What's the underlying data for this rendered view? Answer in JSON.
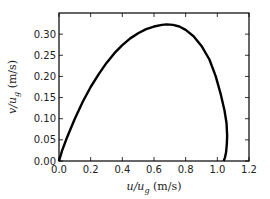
{
  "chart_data": {
    "type": "line",
    "title": "",
    "xlabel": "u/u_g (m/s)",
    "ylabel": "v/u_g (m/s)",
    "xlabel_parts": {
      "num": "u",
      "den": "u",
      "sub": "g",
      "unit": "(m/s)"
    },
    "ylabel_parts": {
      "num": "v",
      "den": "u",
      "sub": "g",
      "unit": "(m/s)"
    },
    "xlim": [
      0.0,
      1.2
    ],
    "ylim": [
      0.0,
      0.35
    ],
    "xticks": [
      "0.0",
      "0.2",
      "0.4",
      "0.6",
      "0.8",
      "1.0",
      "1.2"
    ],
    "yticks": [
      "0.00",
      "0.05",
      "0.10",
      "0.15",
      "0.20",
      "0.25",
      "0.30"
    ],
    "grid": false,
    "legend": null,
    "series": [
      {
        "name": "hodograph",
        "color": "#000000",
        "x": [
          0.0,
          0.02,
          0.05,
          0.1,
          0.15,
          0.2,
          0.25,
          0.3,
          0.35,
          0.4,
          0.45,
          0.5,
          0.55,
          0.6,
          0.65,
          0.68,
          0.72,
          0.76,
          0.8,
          0.85,
          0.9,
          0.95,
          0.99,
          1.02,
          1.045,
          1.058,
          1.062,
          1.06,
          1.055,
          1.048,
          1.04
        ],
        "y": [
          0.0,
          0.025,
          0.055,
          0.1,
          0.14,
          0.175,
          0.205,
          0.232,
          0.255,
          0.274,
          0.29,
          0.302,
          0.312,
          0.318,
          0.322,
          0.323,
          0.322,
          0.318,
          0.31,
          0.295,
          0.272,
          0.24,
          0.2,
          0.16,
          0.12,
          0.09,
          0.06,
          0.04,
          0.02,
          0.008,
          0.0
        ]
      }
    ]
  }
}
